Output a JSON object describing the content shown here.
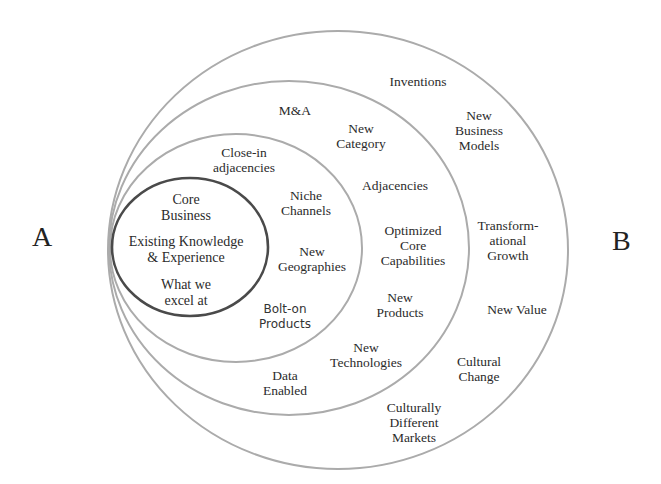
{
  "endpoints": {
    "start": "A",
    "end": "B"
  },
  "colors": {
    "ring_stroke": "#ababab",
    "core_stroke": "#4a4a4a",
    "text": "#2b2b2b",
    "background": "#ffffff"
  },
  "rings": {
    "core": {
      "name": "Core",
      "labels": [
        [
          "Core",
          "Business"
        ],
        [
          "Existing Knowledge",
          "& Experience"
        ],
        [
          "What we",
          "excel at"
        ]
      ]
    },
    "ring1": {
      "name": "Close-in adjacencies ring",
      "labels": [
        [
          "Close-in",
          "adjacencies"
        ],
        [
          "Niche",
          "Channels"
        ],
        [
          "New",
          "Geographies"
        ],
        [
          "Bolt-on",
          "Products"
        ]
      ]
    },
    "ring2": {
      "name": "Adjacencies ring",
      "labels": [
        [
          "M&A"
        ],
        [
          "New",
          "Category"
        ],
        [
          "Adjacencies"
        ],
        [
          "Optimized",
          "Core",
          "Capabilities"
        ],
        [
          "New",
          "Products"
        ],
        [
          "New",
          "Technologies"
        ],
        [
          "Data",
          "Enabled"
        ]
      ]
    },
    "ring3": {
      "name": "Transformational ring",
      "labels": [
        [
          "Inventions"
        ],
        [
          "New",
          "Business",
          "Models"
        ],
        [
          "Transform-",
          "ational",
          "Growth"
        ],
        [
          "New Value"
        ],
        [
          "Cultural",
          "Change"
        ],
        [
          "Culturally",
          "Different",
          "Markets"
        ]
      ]
    }
  }
}
